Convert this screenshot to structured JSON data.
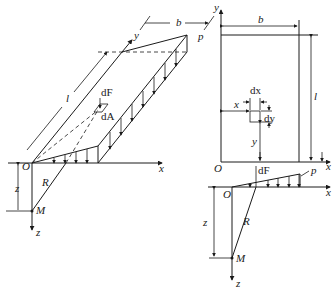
{
  "figure": {
    "left_view": {
      "axes": {
        "x": "x",
        "y": "y",
        "z": "z"
      },
      "origin": "O",
      "point_M": "M",
      "distance_R": "R",
      "depth_z": "z",
      "width_b": "b",
      "length_l": "l",
      "load_p": "p",
      "force_dF": "dF",
      "area_dA": "dA"
    },
    "right_top_view": {
      "axes": {
        "x": "x",
        "y": "y"
      },
      "origin": "O",
      "width_b": "b",
      "length_l": "l",
      "elem_dx": "dx",
      "elem_dy": "dy",
      "coord_x": "x",
      "coord_y": "y"
    },
    "right_side_view": {
      "axes": {
        "x": "x",
        "z": "z"
      },
      "origin": "O",
      "force_dF": "dF",
      "load_p": "p",
      "distance_R": "R",
      "depth_z": "z",
      "point_M": "M"
    },
    "colors": {
      "line": "#1a1a1a",
      "background": "#ffffff"
    }
  }
}
